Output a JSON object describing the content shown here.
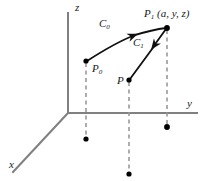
{
  "figure": {
    "kind": "3d-coordinate-diagram",
    "background_color": "#ffffff",
    "axis_color": "#808080",
    "curve_color": "#101010",
    "dash_color": "#999999",
    "point_color": "#000000",
    "axes": {
      "z_label": "z",
      "y_label": "y",
      "x_label": "x"
    },
    "points": [
      {
        "id": "P0",
        "label": "P",
        "subscript": "0",
        "suffix": ""
      },
      {
        "id": "P",
        "label": "P",
        "subscript": "",
        "suffix": ""
      },
      {
        "id": "P1",
        "label": "P",
        "subscript": "1",
        "suffix": " (a, y, z)"
      }
    ],
    "curves": [
      {
        "id": "C0",
        "label": "C",
        "subscript": "0",
        "from": "P0",
        "to": "P1",
        "style": "arc"
      },
      {
        "id": "C1",
        "label": "C",
        "subscript": "1",
        "from": "P",
        "to": "P1",
        "style": "straight"
      }
    ],
    "labels": {
      "p0_base": "P",
      "p0_sub": "0",
      "p_base": "P",
      "p1_base": "P",
      "p1_sub": "1",
      "p1_coords": " (a, y, z)",
      "c0_base": "C",
      "c0_sub": "0",
      "c1_base": "C",
      "c1_sub": "1"
    }
  }
}
